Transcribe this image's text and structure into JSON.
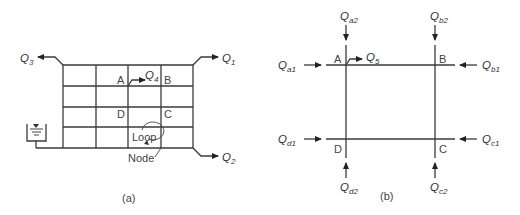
{
  "panel_a": {
    "caption": "(a)",
    "outflows": {
      "q1": {
        "base": "Q",
        "sub": "1"
      },
      "q2": {
        "base": "Q",
        "sub": "2"
      },
      "q3": {
        "base": "Q",
        "sub": "3"
      },
      "q4": {
        "base": "Q",
        "sub": "4"
      }
    },
    "nodes": {
      "a": "A",
      "b": "B",
      "c": "C",
      "d": "D"
    },
    "loop_label": "Loop",
    "node_label": "Node",
    "grid": {
      "columns": 4,
      "rows": 4
    }
  },
  "panel_b": {
    "caption": "(b)",
    "nodes": {
      "a": "A",
      "b": "B",
      "c": "C",
      "d": "D"
    },
    "flows": {
      "qa1": {
        "base": "Q",
        "sub": "a1"
      },
      "qa2": {
        "base": "Q",
        "sub": "a2"
      },
      "qb1": {
        "base": "Q",
        "sub": "b1"
      },
      "qb2": {
        "base": "Q",
        "sub": "b2"
      },
      "qc1": {
        "base": "Q",
        "sub": "c1"
      },
      "qc2": {
        "base": "Q",
        "sub": "c2"
      },
      "qd1": {
        "base": "Q",
        "sub": "d1"
      },
      "qd2": {
        "base": "Q",
        "sub": "d2"
      },
      "q5": {
        "base": "Q",
        "sub": "5"
      }
    }
  }
}
